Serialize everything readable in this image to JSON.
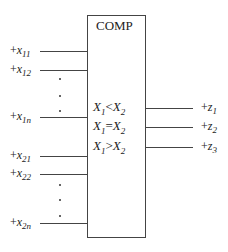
{
  "block": {
    "title": "COMP"
  },
  "inputs": [
    {
      "sign": "+",
      "var": "x",
      "sub": "11"
    },
    {
      "sign": "+",
      "var": "x",
      "sub": "12"
    },
    {
      "sign": "+",
      "var": "x",
      "sub": "1n"
    },
    {
      "sign": "+",
      "var": "x",
      "sub": "21"
    },
    {
      "sign": "+",
      "var": "x",
      "sub": "22"
    },
    {
      "sign": "+",
      "var": "x",
      "sub": "2n"
    }
  ],
  "conditions": [
    {
      "a": "X",
      "asub": "1",
      "op": "<",
      "b": "X",
      "bsub": "2"
    },
    {
      "a": "X",
      "asub": "1",
      "op": "=",
      "b": "X",
      "bsub": "2"
    },
    {
      "a": "X",
      "asub": "1",
      "op": ">",
      "b": "X",
      "bsub": "2"
    }
  ],
  "outputs": [
    {
      "sign": "+",
      "var": "z",
      "sub": "1"
    },
    {
      "sign": "+",
      "var": "z",
      "sub": "2"
    },
    {
      "sign": "+",
      "var": "z",
      "sub": "3"
    }
  ]
}
